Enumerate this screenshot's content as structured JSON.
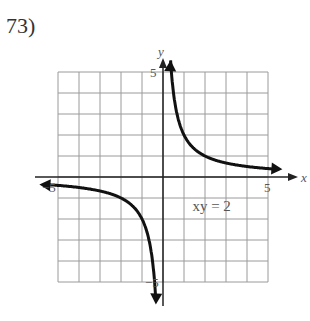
{
  "problem": {
    "label": "73)"
  },
  "chart_data": {
    "type": "line",
    "title": "",
    "equation": "xy = 2",
    "function": "y = 2/x",
    "xlabel": "x",
    "ylabel": "y",
    "xlim": [
      -5,
      5
    ],
    "ylim": [
      -5,
      5
    ],
    "grid": true,
    "tick_labels": {
      "x_min": "−5",
      "x_max": "5",
      "y_max": "5",
      "y_min": "−5"
    },
    "series": [
      {
        "name": "branch-quadrant-I",
        "x": [
          0.4,
          0.5,
          1,
          2,
          3,
          4,
          5
        ],
        "y": [
          5,
          4,
          2,
          1,
          0.67,
          0.5,
          0.4
        ]
      },
      {
        "name": "branch-quadrant-III",
        "x": [
          -5,
          -4,
          -3,
          -2,
          -1,
          -0.5,
          -0.4
        ],
        "y": [
          -0.4,
          -0.5,
          -0.67,
          -1,
          -2,
          -4,
          -5
        ]
      }
    ],
    "asymptotes": [
      "x = 0",
      "y = 0"
    ]
  }
}
